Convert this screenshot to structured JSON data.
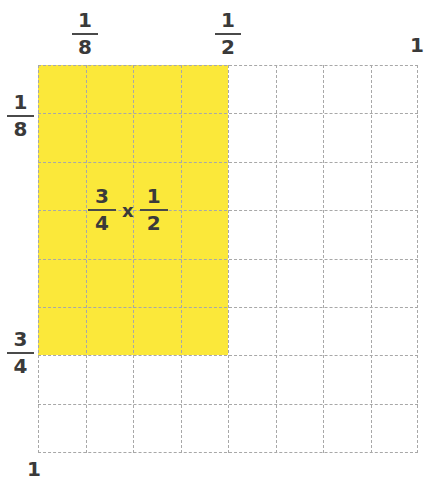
{
  "diagram": {
    "grid": {
      "columns": 8,
      "rows": 8,
      "shaded_columns": 4,
      "shaded_rows": 6
    },
    "colors": {
      "shade": "#fbe83a",
      "gridline": "#a8a8a8",
      "text": "#3a3a3a"
    },
    "top_labels": [
      {
        "numerator": "1",
        "denominator": "8"
      },
      {
        "numerator": "1",
        "denominator": "2"
      },
      {
        "whole": "1"
      }
    ],
    "left_labels": [
      {
        "numerator": "1",
        "denominator": "8"
      },
      {
        "numerator": "3",
        "denominator": "4"
      },
      {
        "whole": "1"
      }
    ],
    "expression": {
      "left": {
        "numerator": "3",
        "denominator": "4"
      },
      "operator": "x",
      "right": {
        "numerator": "1",
        "denominator": "2"
      }
    }
  }
}
